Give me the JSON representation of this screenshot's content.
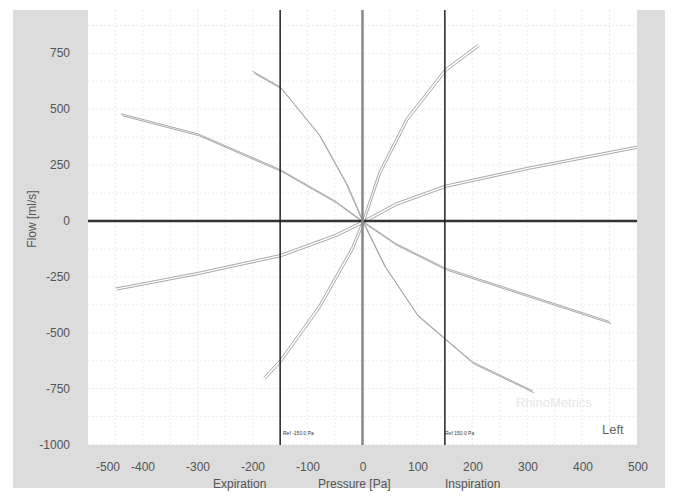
{
  "chart_data": {
    "type": "line",
    "title": "",
    "xlabel": "Pressure [Pa]",
    "ylabel": "Flow [ml/s]",
    "xlim": [
      -500,
      500
    ],
    "ylim": [
      -1000,
      850
    ],
    "x_ticks": [
      -500,
      -400,
      -300,
      -200,
      -100,
      0,
      100,
      200,
      300,
      400,
      500
    ],
    "y_ticks": [
      750,
      500,
      250,
      0,
      -250,
      -500,
      -750,
      -1000
    ],
    "x_sublabels": {
      "left": "Expiration",
      "center": "Pressure [Pa]",
      "right": "Inspiration"
    },
    "reference_lines": [
      {
        "x": -150,
        "label": "Ref -150.0 Pa"
      },
      {
        "x": 150,
        "label": "Ref 150.0 Pa"
      }
    ],
    "grid": true,
    "annotations": [
      "RhinoMetrics",
      "Left"
    ],
    "series": [
      {
        "name": "curve-upper-left-shallow",
        "points": [
          [
            -440,
            480
          ],
          [
            -300,
            390
          ],
          [
            -150,
            230
          ],
          [
            -50,
            90
          ],
          [
            0,
            0
          ]
        ]
      },
      {
        "name": "curve-upper-left-steep",
        "points": [
          [
            -200,
            670
          ],
          [
            -150,
            600
          ],
          [
            -80,
            390
          ],
          [
            -30,
            170
          ],
          [
            0,
            0
          ]
        ]
      },
      {
        "name": "curve-upper-right-steep",
        "points": [
          [
            0,
            0
          ],
          [
            30,
            220
          ],
          [
            80,
            460
          ],
          [
            150,
            680
          ],
          [
            210,
            790
          ]
        ]
      },
      {
        "name": "curve-upper-right-shallow",
        "points": [
          [
            0,
            0
          ],
          [
            60,
            80
          ],
          [
            150,
            160
          ],
          [
            300,
            240
          ],
          [
            500,
            335
          ]
        ]
      },
      {
        "name": "curve-lower-left-shallow",
        "points": [
          [
            -450,
            -300
          ],
          [
            -300,
            -230
          ],
          [
            -150,
            -150
          ],
          [
            -50,
            -60
          ],
          [
            0,
            0
          ]
        ]
      },
      {
        "name": "curve-lower-left-steep",
        "points": [
          [
            -180,
            -700
          ],
          [
            -150,
            -620
          ],
          [
            -80,
            -380
          ],
          [
            -20,
            -120
          ],
          [
            0,
            0
          ]
        ]
      },
      {
        "name": "curve-lower-right-steep",
        "points": [
          [
            0,
            0
          ],
          [
            40,
            -200
          ],
          [
            100,
            -420
          ],
          [
            200,
            -630
          ],
          [
            310,
            -760
          ]
        ]
      },
      {
        "name": "curve-lower-right-shallow",
        "points": [
          [
            0,
            0
          ],
          [
            60,
            -100
          ],
          [
            150,
            -210
          ],
          [
            300,
            -330
          ],
          [
            450,
            -450
          ]
        ]
      }
    ]
  },
  "labels": {
    "y_axis": "Flow [ml/s]",
    "x_center": "Pressure [Pa]",
    "x_left": "Expiration",
    "x_right": "Inspiration",
    "ref_neg": "Ref -150.0 Pa",
    "ref_pos": "Ref 150.0 Pa",
    "watermark": "RhinoMetrics",
    "side": "Left"
  },
  "ticks": {
    "y": [
      "750",
      "500",
      "250",
      "0",
      "-250",
      "-500",
      "-750",
      "-1000"
    ],
    "x": [
      "-500",
      "-400",
      "-300",
      "-200",
      "-100",
      "0",
      "100",
      "200",
      "300",
      "400",
      "500"
    ]
  },
  "colors": {
    "frame": "#dcdcdc",
    "curve": "#a8a8a8",
    "axis": "#333333",
    "zero_vertical": "#888888",
    "ref_line": "#222222"
  }
}
